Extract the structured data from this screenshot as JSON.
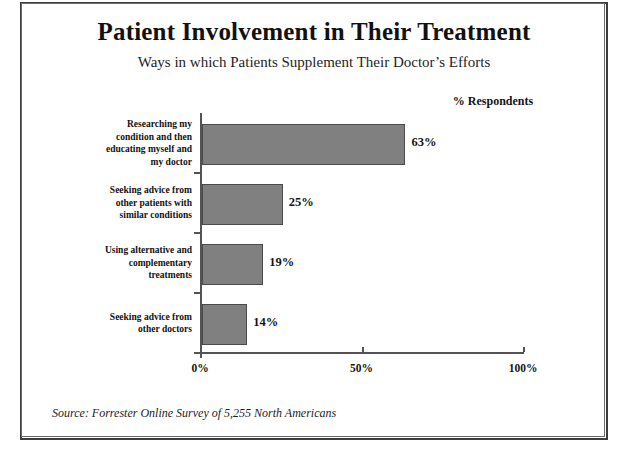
{
  "document": {
    "title": "Patient Involvement in Their Treatment",
    "subtitle": "Ways in which Patients Supplement Their Doctor’s Efforts",
    "legend_label": "% Respondents",
    "source_note": "Source: Forrester Online Survey of 5,255 North Americans",
    "frame_color": "#3d3d3d"
  },
  "chart_data": {
    "type": "bar",
    "orientation": "horizontal",
    "title": "Patient Involvement in Their Treatment",
    "subtitle": "Ways in which Patients Supplement Their Doctor’s Efforts",
    "xlabel": "",
    "ylabel": "",
    "legend": [
      "% Respondents"
    ],
    "legend_position": "top-right",
    "grid": false,
    "xlim": [
      0,
      100
    ],
    "xticks": [
      0,
      50,
      100
    ],
    "xtick_labels": [
      "0%",
      "50%",
      "100%"
    ],
    "categories": [
      "Researching my condition and then educating myself and my doctor",
      "Seeking advice from other patients with similar conditions",
      "Using alternative and complementary treatments",
      "Seeking advice from other doctors"
    ],
    "category_lines": [
      [
        "Researching my",
        "condition and then",
        "educating myself and",
        "my doctor"
      ],
      [
        "Seeking advice from",
        "other patients with",
        "similar conditions"
      ],
      [
        "Using alternative and",
        "complementary",
        "treatments"
      ],
      [
        "Seeking advice from",
        "other doctors"
      ]
    ],
    "values": [
      63,
      25,
      19,
      14
    ],
    "value_labels": [
      "63%",
      "25%",
      "19%",
      "14%"
    ],
    "bar_color": "#808080",
    "bar_border_color": "#4a4a4a",
    "axis_color": "#545454"
  }
}
